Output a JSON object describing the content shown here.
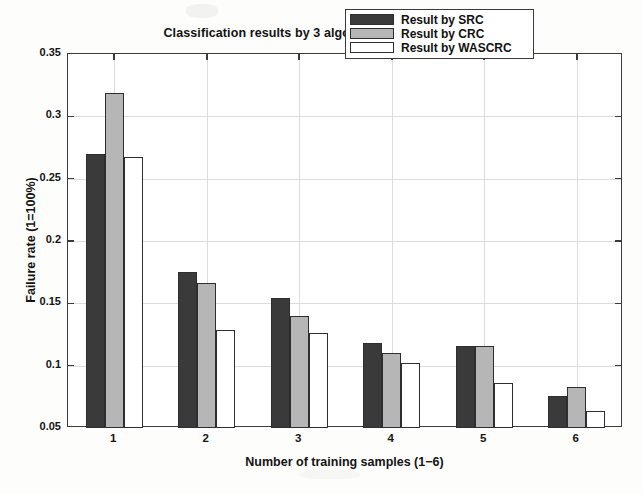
{
  "chart_data": {
    "type": "bar",
    "title": "Classification results by 3 algorithms on ORL face database",
    "xlabel": "Number of training samples (1−6)",
    "ylabel": "Failure rate (1=100%)",
    "categories": [
      "1",
      "2",
      "3",
      "4",
      "5",
      "6"
    ],
    "series": [
      {
        "name": "Result by SRC",
        "key": "src",
        "color": "#3a3a3a",
        "values": [
          0.27,
          0.175,
          0.154,
          0.118,
          0.116,
          0.076
        ]
      },
      {
        "name": "Result by CRC",
        "key": "crc",
        "color": "#b6b6b6",
        "values": [
          0.319,
          0.166,
          0.14,
          0.11,
          0.116,
          0.083
        ]
      },
      {
        "name": "Result by WASCRC",
        "key": "wascrc",
        "color": "#ffffff",
        "values": [
          0.267,
          0.129,
          0.126,
          0.102,
          0.086,
          0.064
        ]
      }
    ],
    "ylim": [
      0.05,
      0.35
    ],
    "yticks": [
      0.05,
      0.1,
      0.15,
      0.2,
      0.25,
      0.3,
      0.35
    ],
    "ytick_labels": [
      "0.05",
      "0.1",
      "0.15",
      "0.2",
      "0.25",
      "0.3",
      "0.35"
    ],
    "xticks": [
      1,
      2,
      3,
      4,
      5,
      6
    ],
    "xtick_labels": [
      "1",
      "2",
      "3",
      "4",
      "5",
      "6"
    ],
    "xlim": [
      0.5,
      6.5
    ],
    "grid": true,
    "legend_position": "top-right",
    "bar_baseline": 0.05
  },
  "legend": {
    "items": [
      {
        "label": "Result by SRC",
        "swatch": "src"
      },
      {
        "label": "Result by CRC",
        "swatch": "crc"
      },
      {
        "label": "Result by WASCRC",
        "swatch": "wascrc"
      }
    ]
  }
}
